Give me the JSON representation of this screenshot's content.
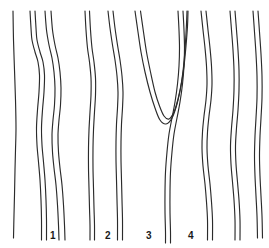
{
  "figure": {
    "width": 269,
    "height": 248,
    "background_color": "#ffffff",
    "stroke_color": "#2b2b2b",
    "label_color": "#1a1a1a"
  },
  "labels": [
    {
      "text": "1",
      "x": 50,
      "y": 231
    },
    {
      "text": "2",
      "x": 105,
      "y": 231
    },
    {
      "text": "3",
      "x": 146,
      "y": 231
    },
    {
      "text": "4",
      "x": 188,
      "y": 231
    }
  ],
  "chart_data": {
    "type": "line",
    "title": "",
    "xlabel": "",
    "ylabel": "",
    "grid": false,
    "legend_position": "none",
    "xlim": [
      0,
      269
    ],
    "ylim": [
      0,
      248
    ],
    "series": [
      {
        "name": "trace-a1",
        "group": 1,
        "points": [
          [
            13,
            11
          ],
          [
            13.5,
            40
          ],
          [
            14.5,
            70
          ],
          [
            15.5,
            100
          ],
          [
            16,
            128
          ],
          [
            15.5,
            150
          ],
          [
            15,
            170
          ],
          [
            14.5,
            195
          ],
          [
            14,
            215
          ],
          [
            13.5,
            238
          ]
        ]
      },
      {
        "name": "trace-b1",
        "group": 1,
        "points": [
          [
            30,
            11
          ],
          [
            31,
            28
          ],
          [
            32,
            40
          ],
          [
            35,
            52
          ],
          [
            38,
            62
          ],
          [
            39.5,
            75
          ],
          [
            39,
            92
          ],
          [
            37.5,
            110
          ],
          [
            36.5,
            128
          ],
          [
            37,
            145
          ],
          [
            38.5,
            162
          ],
          [
            40,
            180
          ],
          [
            41,
            200
          ],
          [
            41.5,
            220
          ],
          [
            41.5,
            240
          ]
        ]
      },
      {
        "name": "trace-b2",
        "group": 1,
        "points": [
          [
            35,
            11
          ],
          [
            36,
            28
          ],
          [
            37,
            40
          ],
          [
            40,
            52
          ],
          [
            43,
            62
          ],
          [
            44.5,
            75
          ],
          [
            44,
            92
          ],
          [
            42.5,
            110
          ],
          [
            41.5,
            128
          ],
          [
            42,
            145
          ],
          [
            43.5,
            162
          ],
          [
            45,
            180
          ],
          [
            46,
            200
          ],
          [
            46.5,
            220
          ],
          [
            46.5,
            240
          ]
        ]
      },
      {
        "name": "trace-c1",
        "group": 1,
        "points": [
          [
            45,
            11
          ],
          [
            46.5,
            30
          ],
          [
            49,
            45
          ],
          [
            52,
            58
          ],
          [
            54,
            72
          ],
          [
            55,
            88
          ],
          [
            54.5,
            105
          ],
          [
            53,
            120
          ],
          [
            52,
            135
          ],
          [
            52.5,
            152
          ],
          [
            54,
            168
          ],
          [
            56,
            185
          ],
          [
            57.5,
            205
          ],
          [
            58.5,
            225
          ],
          [
            59,
            240
          ]
        ]
      },
      {
        "name": "trace-c2",
        "group": 1,
        "points": [
          [
            51,
            11
          ],
          [
            52.5,
            30
          ],
          [
            55,
            45
          ],
          [
            58,
            58
          ],
          [
            60,
            72
          ],
          [
            61,
            88
          ],
          [
            60.5,
            105
          ],
          [
            59,
            120
          ],
          [
            58,
            135
          ],
          [
            58.5,
            152
          ],
          [
            60,
            168
          ],
          [
            62,
            185
          ],
          [
            63.5,
            205
          ],
          [
            64.5,
            225
          ],
          [
            65,
            240
          ]
        ]
      },
      {
        "name": "trace-d1",
        "group": 2,
        "points": [
          [
            85,
            11
          ],
          [
            86,
            30
          ],
          [
            87.5,
            48
          ],
          [
            89.5,
            62
          ],
          [
            91,
            78
          ],
          [
            91,
            95
          ],
          [
            90,
            112
          ],
          [
            89,
            130
          ],
          [
            88.5,
            148
          ],
          [
            88.5,
            168
          ],
          [
            89,
            188
          ],
          [
            89.5,
            208
          ],
          [
            90,
            225
          ],
          [
            90,
            240
          ]
        ]
      },
      {
        "name": "trace-d2",
        "group": 2,
        "points": [
          [
            89.5,
            11
          ],
          [
            90.5,
            30
          ],
          [
            92,
            48
          ],
          [
            94,
            62
          ],
          [
            95.5,
            78
          ],
          [
            95.5,
            95
          ],
          [
            94.5,
            112
          ],
          [
            93.5,
            130
          ],
          [
            93,
            148
          ],
          [
            93,
            168
          ],
          [
            93.5,
            188
          ],
          [
            94,
            208
          ],
          [
            94.5,
            225
          ],
          [
            94.5,
            240
          ]
        ]
      },
      {
        "name": "trace-e1",
        "group": 2,
        "points": [
          [
            108,
            11
          ],
          [
            110,
            28
          ],
          [
            112.5,
            45
          ],
          [
            115,
            60
          ],
          [
            117,
            76
          ],
          [
            118,
            92
          ],
          [
            117.5,
            108
          ],
          [
            116.5,
            124
          ],
          [
            116,
            142
          ],
          [
            116,
            160
          ],
          [
            116.5,
            180
          ],
          [
            117,
            200
          ],
          [
            117.5,
            220
          ],
          [
            117.5,
            240
          ]
        ]
      },
      {
        "name": "trace-e2",
        "group": 2,
        "points": [
          [
            113,
            11
          ],
          [
            115,
            28
          ],
          [
            117.5,
            45
          ],
          [
            120,
            60
          ],
          [
            122,
            76
          ],
          [
            123,
            92
          ],
          [
            122.5,
            108
          ],
          [
            121.5,
            124
          ],
          [
            121,
            142
          ],
          [
            121,
            160
          ],
          [
            121.5,
            180
          ],
          [
            122,
            200
          ],
          [
            122.5,
            220
          ],
          [
            122.5,
            240
          ]
        ]
      },
      {
        "name": "trace-v-outer",
        "group": 3,
        "points": [
          [
            135,
            11
          ],
          [
            138,
            32
          ],
          [
            141,
            52
          ],
          [
            145,
            72
          ],
          [
            150,
            92
          ],
          [
            155,
            108
          ],
          [
            160,
            120
          ],
          [
            166,
            124
          ],
          [
            172,
            118
          ],
          [
            177,
            104
          ],
          [
            181,
            86
          ],
          [
            184,
            66
          ],
          [
            186,
            46
          ],
          [
            187.5,
            26
          ],
          [
            188,
            11
          ]
        ]
      },
      {
        "name": "trace-v-inner",
        "group": 3,
        "points": [
          [
            140.5,
            11
          ],
          [
            143.5,
            32
          ],
          [
            146.5,
            52
          ],
          [
            150.5,
            72
          ],
          [
            155,
            92
          ],
          [
            159.5,
            106
          ],
          [
            164,
            116
          ],
          [
            169,
            119
          ],
          [
            174,
            112
          ],
          [
            178,
            99
          ],
          [
            181.5,
            82
          ],
          [
            184,
            62
          ],
          [
            185.5,
            42
          ],
          [
            186.5,
            24
          ],
          [
            187,
            11
          ]
        ]
      },
      {
        "name": "trace-f1",
        "group": 3,
        "points": [
          [
            178,
            11
          ],
          [
            179,
            30
          ],
          [
            179.5,
            48
          ],
          [
            179,
            66
          ],
          [
            177.5,
            84
          ],
          [
            175,
            102
          ],
          [
            172,
            118
          ],
          [
            169,
            134
          ],
          [
            167,
            152
          ],
          [
            165.5,
            172
          ],
          [
            165,
            192
          ],
          [
            165,
            212
          ],
          [
            165.5,
            232
          ],
          [
            165.5,
            243
          ]
        ]
      },
      {
        "name": "trace-f2",
        "group": 3,
        "points": [
          [
            183,
            11
          ],
          [
            184,
            30
          ],
          [
            184.5,
            48
          ],
          [
            184,
            66
          ],
          [
            182.5,
            84
          ],
          [
            180,
            102
          ],
          [
            177,
            118
          ],
          [
            174,
            134
          ],
          [
            172,
            152
          ],
          [
            170.5,
            172
          ],
          [
            170,
            192
          ],
          [
            170,
            212
          ],
          [
            170.5,
            232
          ],
          [
            170.5,
            243
          ]
        ]
      },
      {
        "name": "trace-g1",
        "group": 4,
        "points": [
          [
            201,
            11
          ],
          [
            203,
            30
          ],
          [
            205,
            48
          ],
          [
            206.5,
            66
          ],
          [
            207,
            84
          ],
          [
            206,
            100
          ],
          [
            204,
            116
          ],
          [
            202.5,
            132
          ],
          [
            202,
            148
          ],
          [
            203,
            166
          ],
          [
            205,
            184
          ],
          [
            206.5,
            202
          ],
          [
            207.5,
            220
          ],
          [
            207.5,
            240
          ]
        ]
      },
      {
        "name": "trace-g2",
        "group": 4,
        "points": [
          [
            206,
            11
          ],
          [
            208,
            30
          ],
          [
            210,
            48
          ],
          [
            211.5,
            66
          ],
          [
            212,
            84
          ],
          [
            211,
            100
          ],
          [
            209,
            116
          ],
          [
            207.5,
            132
          ],
          [
            207,
            148
          ],
          [
            208,
            166
          ],
          [
            210,
            184
          ],
          [
            211.5,
            202
          ],
          [
            212.5,
            220
          ],
          [
            212.5,
            240
          ]
        ]
      },
      {
        "name": "trace-h1",
        "group": 4,
        "points": [
          [
            230,
            11
          ],
          [
            231.5,
            30
          ],
          [
            233,
            50
          ],
          [
            234,
            70
          ],
          [
            234,
            90
          ],
          [
            233,
            110
          ],
          [
            231.5,
            128
          ],
          [
            230.5,
            146
          ],
          [
            231,
            164
          ],
          [
            232.5,
            182
          ],
          [
            234,
            200
          ],
          [
            235,
            220
          ],
          [
            235,
            240
          ]
        ]
      },
      {
        "name": "trace-h2",
        "group": 4,
        "points": [
          [
            235,
            11
          ],
          [
            236.5,
            30
          ],
          [
            238,
            50
          ],
          [
            239,
            70
          ],
          [
            239,
            90
          ],
          [
            238,
            110
          ],
          [
            236.5,
            128
          ],
          [
            235.5,
            146
          ],
          [
            236,
            164
          ],
          [
            237.5,
            182
          ],
          [
            239,
            200
          ],
          [
            240,
            220
          ],
          [
            240,
            240
          ]
        ]
      },
      {
        "name": "trace-i1",
        "group": 4,
        "points": [
          [
            253,
            11
          ],
          [
            254.5,
            32
          ],
          [
            256,
            54
          ],
          [
            257,
            76
          ],
          [
            257,
            98
          ],
          [
            256,
            118
          ],
          [
            255,
            136
          ],
          [
            254.5,
            156
          ],
          [
            255,
            176
          ],
          [
            256,
            196
          ],
          [
            257,
            216
          ],
          [
            257.5,
            238
          ]
        ]
      },
      {
        "name": "trace-i2",
        "group": 4,
        "points": [
          [
            258,
            11
          ],
          [
            259.5,
            32
          ],
          [
            261,
            54
          ],
          [
            262,
            76
          ],
          [
            262,
            98
          ],
          [
            261,
            118
          ],
          [
            260,
            136
          ],
          [
            259.5,
            156
          ],
          [
            260,
            176
          ],
          [
            261,
            196
          ],
          [
            262,
            216
          ],
          [
            262.5,
            238
          ]
        ]
      }
    ]
  }
}
